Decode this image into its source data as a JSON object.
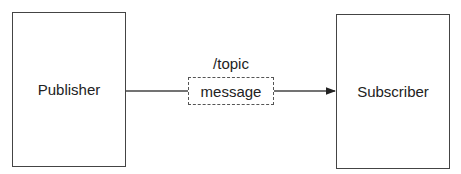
{
  "diagram": {
    "publisher": {
      "label": "Publisher"
    },
    "subscriber": {
      "label": "Subscriber"
    },
    "topic": {
      "label": "/topic"
    },
    "message": {
      "label": "message"
    },
    "edges": [
      {
        "from": "publisher",
        "to": "message",
        "style": "solid",
        "arrow": false
      },
      {
        "from": "message",
        "to": "subscriber",
        "style": "solid",
        "arrow": true
      }
    ]
  }
}
